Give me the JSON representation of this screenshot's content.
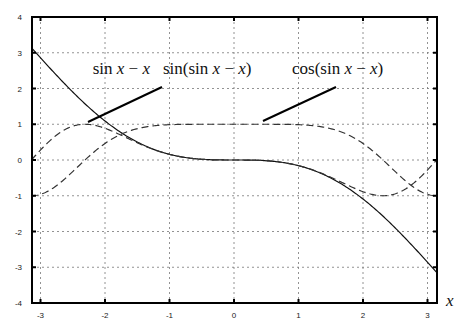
{
  "chart_data": {
    "type": "line",
    "title": "",
    "xlabel": "x",
    "ylabel": "",
    "xlim": [
      -3.14159,
      3.14159
    ],
    "ylim": [
      -4,
      4
    ],
    "grid": true,
    "x_ticks": [
      -3,
      -2,
      -1,
      0,
      1,
      2,
      3
    ],
    "y_ticks": [
      4,
      3,
      2,
      1,
      0,
      -1,
      -2,
      -3,
      -4
    ],
    "x": [
      -3.14159,
      -3,
      -2,
      -1,
      0,
      1,
      2,
      3,
      3.14159
    ],
    "series": [
      {
        "name": "sin x − x",
        "style": "solid",
        "values": [
          3.142,
          2.859,
          1.091,
          0.159,
          0,
          -0.159,
          -1.091,
          -2.859,
          -3.142
        ]
      },
      {
        "name": "sin(sin x − x)",
        "style": "dashed",
        "values": [
          0.0,
          0.279,
          0.887,
          0.158,
          0,
          -0.158,
          -0.887,
          -0.279,
          0.0
        ]
      },
      {
        "name": "cos(sin x − x)",
        "style": "dashed",
        "values": [
          -1.0,
          -0.96,
          0.462,
          0.987,
          1.0,
          0.987,
          0.462,
          -0.96,
          -1.0
        ]
      }
    ],
    "annotations": [
      {
        "text_parts": [
          {
            "t": "sin ",
            "i": false
          },
          {
            "t": "x",
            "i": true
          },
          {
            "t": " − ",
            "i": false
          },
          {
            "t": "x",
            "i": true
          }
        ],
        "x": 150,
        "y": 74,
        "anchor": "end"
      },
      {
        "text_parts": [
          {
            "t": "sin(sin ",
            "i": false
          },
          {
            "t": "x",
            "i": true
          },
          {
            "t": " − ",
            "i": false
          },
          {
            "t": "x",
            "i": true
          },
          {
            "t": ")",
            "i": false
          }
        ],
        "x": 163,
        "y": 74,
        "anchor": "start"
      },
      {
        "text_parts": [
          {
            "t": "cos(sin ",
            "i": false
          },
          {
            "t": "x",
            "i": true
          },
          {
            "t": " − ",
            "i": false
          },
          {
            "t": "x",
            "i": true
          },
          {
            "t": ")",
            "i": false
          }
        ],
        "x": 292,
        "y": 74,
        "anchor": "start"
      }
    ],
    "pointers": [
      {
        "x1": 88,
        "y1": 122,
        "x2": 162,
        "y2": 87
      },
      {
        "x1": 263,
        "y1": 121,
        "x2": 336,
        "y2": 87
      }
    ]
  }
}
